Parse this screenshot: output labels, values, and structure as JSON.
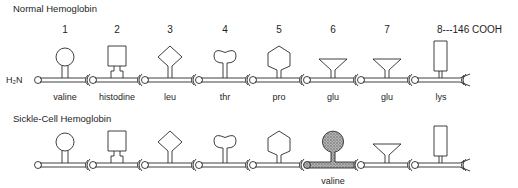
{
  "diagram": {
    "normal": {
      "title": "Normal Hemoglobin",
      "n_terminus": "H₂N",
      "positions": [
        "1",
        "2",
        "3",
        "4",
        "5",
        "6",
        "7"
      ],
      "end_label": "8---146 COOH",
      "residues": [
        {
          "pos": "1",
          "name": "valine",
          "shape": "circle"
        },
        {
          "pos": "2",
          "name": "histodine",
          "shape": "square"
        },
        {
          "pos": "3",
          "name": "leu",
          "shape": "diamond"
        },
        {
          "pos": "4",
          "name": "thr",
          "shape": "bilobe"
        },
        {
          "pos": "5",
          "name": "pro",
          "shape": "hexagon"
        },
        {
          "pos": "6",
          "name": "glu",
          "shape": "funnel"
        },
        {
          "pos": "7",
          "name": "glu",
          "shape": "funnel"
        },
        {
          "pos": "8",
          "name": "lys",
          "shape": "tall-rect"
        }
      ]
    },
    "sickle": {
      "title": "Sickle-Cell Hemoglobin",
      "mutation_label": "valine",
      "mutation_position": "6",
      "mutation_fill": "#9a9a9a"
    },
    "colors": {
      "line": "#2a2a2a",
      "background": "#ffffff"
    }
  }
}
